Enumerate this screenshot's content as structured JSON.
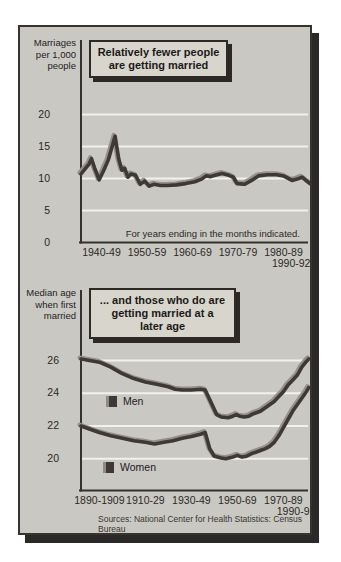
{
  "colors": {
    "page_bg": "#ffffff",
    "panel_bg": "#c9c8c3",
    "panel_border": "#37342f",
    "panel_shadow": "#2b2927",
    "line": "#3e3837",
    "line_highlight": "#95908a",
    "gridline": "#f2f1ed",
    "axis": "#35322d",
    "title_box_bg": "#d8d5cd",
    "ink": "#23201e"
  },
  "chart_data": [
    {
      "type": "line",
      "title": "Relatively fewer people are getting married",
      "title_lines": [
        "Relatively fewer people",
        "are getting married"
      ],
      "ylabel": "Marriages per 1,000 people",
      "ylabel_lines": [
        "Marriages",
        "per 1,000",
        "people"
      ],
      "note": "For years ending in the months indicated.",
      "ylim": [
        0,
        21.5
      ],
      "grid": "horizontal-white",
      "yticks": [
        0,
        5,
        10,
        15,
        20
      ],
      "xticks": [
        {
          "label": "1940-49",
          "year": 1944.5,
          "row": 0
        },
        {
          "label": "1950-59",
          "year": 1954.5,
          "row": 0
        },
        {
          "label": "1960-69",
          "year": 1964.5,
          "row": 0
        },
        {
          "label": "1970-79",
          "year": 1974.5,
          "row": 0
        },
        {
          "label": "1980-89",
          "year": 1984.5,
          "row": 0
        },
        {
          "label": "1990-92",
          "year": 1986.2,
          "row": 1
        }
      ],
      "series": [
        {
          "name": "Marriage rate",
          "points": [
            [
              1940,
              10.7
            ],
            [
              1941,
              11.6
            ],
            [
              1941.8,
              12.3
            ],
            [
              1942.3,
              13.1
            ],
            [
              1943,
              11.6
            ],
            [
              1944,
              9.8
            ],
            [
              1945,
              11.3
            ],
            [
              1946,
              12.9
            ],
            [
              1947.5,
              16.6
            ],
            [
              1948.3,
              13.0
            ],
            [
              1949,
              11.3
            ],
            [
              1949.6,
              11.6
            ],
            [
              1950.3,
              10.2
            ],
            [
              1951,
              10.7
            ],
            [
              1952,
              10.5
            ],
            [
              1953,
              9.1
            ],
            [
              1954,
              9.6
            ],
            [
              1955,
              8.8
            ],
            [
              1956,
              9.1
            ],
            [
              1957.5,
              8.9
            ],
            [
              1959,
              8.9
            ],
            [
              1961,
              9.0
            ],
            [
              1963,
              9.2
            ],
            [
              1965,
              9.5
            ],
            [
              1966.5,
              9.9
            ],
            [
              1967.5,
              10.4
            ],
            [
              1968.5,
              10.3
            ],
            [
              1969.5,
              10.5
            ],
            [
              1971,
              10.8
            ],
            [
              1972.5,
              10.5
            ],
            [
              1973.5,
              10.2
            ],
            [
              1974.3,
              9.2
            ],
            [
              1976,
              9.1
            ],
            [
              1977.5,
              9.7
            ],
            [
              1979,
              10.4
            ],
            [
              1981,
              10.6
            ],
            [
              1983,
              10.6
            ],
            [
              1984.5,
              10.4
            ],
            [
              1986.4,
              9.7
            ],
            [
              1987.5,
              9.9
            ],
            [
              1988.6,
              10.2
            ],
            [
              1990,
              9.4
            ],
            [
              1990.6,
              9.1
            ]
          ]
        }
      ]
    },
    {
      "type": "line",
      "title": "... and those who do are getting married at a later age",
      "title_lines": [
        "... and those who do are",
        "getting married at a",
        "later age"
      ],
      "ylabel": "Median age when first married",
      "ylabel_lines": [
        "Median age",
        "when first",
        "married"
      ],
      "source": "Sources: National Center for Health Statistics: Census Bureau",
      "ylim": [
        19,
        27
      ],
      "grid": "horizontal-white",
      "yticks": [
        20,
        22,
        24,
        26
      ],
      "xticks": [
        {
          "label": "1890-1909",
          "year": 1900,
          "row": 0
        },
        {
          "label": "1910-29",
          "year": 1920,
          "row": 0
        },
        {
          "label": "1930-49",
          "year": 1940,
          "row": 0
        },
        {
          "label": "1950-69",
          "year": 1960,
          "row": 0
        },
        {
          "label": "1970-89",
          "year": 1980,
          "row": 0
        },
        {
          "label": "1990-91",
          "year": 1985.5,
          "row": 1
        }
      ],
      "legend_position": "inside-left",
      "series": [
        {
          "name": "Men",
          "points": [
            [
              1892,
              26.1
            ],
            [
              1900,
              25.9
            ],
            [
              1905,
              25.6
            ],
            [
              1910,
              25.2
            ],
            [
              1915,
              24.9
            ],
            [
              1920,
              24.7
            ],
            [
              1925,
              24.55
            ],
            [
              1930,
              24.4
            ],
            [
              1933,
              24.25
            ],
            [
              1936,
              24.2
            ],
            [
              1940,
              24.2
            ],
            [
              1944,
              24.25
            ],
            [
              1946,
              24.2
            ],
            [
              1949,
              23.3
            ],
            [
              1951,
              22.7
            ],
            [
              1953,
              22.55
            ],
            [
              1956,
              22.5
            ],
            [
              1958,
              22.6
            ],
            [
              1959.5,
              22.7
            ],
            [
              1961,
              22.6
            ],
            [
              1963,
              22.55
            ],
            [
              1965,
              22.6
            ],
            [
              1967,
              22.75
            ],
            [
              1970,
              22.9
            ],
            [
              1972,
              23.1
            ],
            [
              1974,
              23.3
            ],
            [
              1976,
              23.5
            ],
            [
              1978,
              23.8
            ],
            [
              1980,
              24.1
            ],
            [
              1982,
              24.5
            ],
            [
              1984,
              24.8
            ],
            [
              1986,
              25.1
            ],
            [
              1988,
              25.6
            ],
            [
              1990,
              25.95
            ],
            [
              1991,
              26.1
            ]
          ]
        },
        {
          "name": "Women",
          "points": [
            [
              1892,
              22.0
            ],
            [
              1900,
              21.6
            ],
            [
              1905,
              21.4
            ],
            [
              1910,
              21.25
            ],
            [
              1915,
              21.1
            ],
            [
              1920,
              21.0
            ],
            [
              1924,
              20.9
            ],
            [
              1928,
              21.0
            ],
            [
              1932,
              21.1
            ],
            [
              1936,
              21.25
            ],
            [
              1940,
              21.35
            ],
            [
              1944,
              21.5
            ],
            [
              1946,
              21.6
            ],
            [
              1948,
              20.6
            ],
            [
              1950,
              20.15
            ],
            [
              1953,
              20.05
            ],
            [
              1955,
              20.0
            ],
            [
              1958,
              20.1
            ],
            [
              1960,
              20.2
            ],
            [
              1962,
              20.1
            ],
            [
              1964,
              20.15
            ],
            [
              1966,
              20.3
            ],
            [
              1968,
              20.4
            ],
            [
              1970,
              20.5
            ],
            [
              1972,
              20.6
            ],
            [
              1974,
              20.75
            ],
            [
              1976,
              21.0
            ],
            [
              1978,
              21.4
            ],
            [
              1980,
              21.9
            ],
            [
              1982,
              22.4
            ],
            [
              1984,
              22.9
            ],
            [
              1986,
              23.3
            ],
            [
              1988,
              23.7
            ],
            [
              1990,
              24.1
            ],
            [
              1991,
              24.35
            ]
          ]
        }
      ]
    }
  ]
}
